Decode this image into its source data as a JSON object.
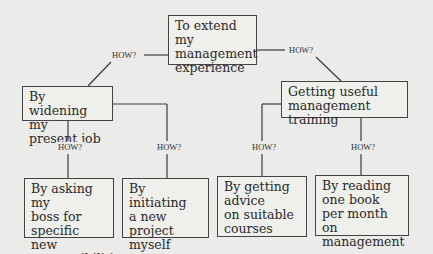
{
  "diagram": {
    "type": "how-tree",
    "root": {
      "label": "To extend\nmy management\nexperience"
    },
    "connector_label": "HOW?",
    "branches": [
      {
        "label": "By widening my\npresent job",
        "children": [
          {
            "label": "By asking my\nboss for\nspecific new\nresponsibilities"
          },
          {
            "label": "By initiating\na new\nproject myself"
          }
        ]
      },
      {
        "label": "Getting useful\nmanagement training",
        "children": [
          {
            "label": "By getting\nadvice\non suitable\ncourses"
          },
          {
            "label": "By reading\none book\nper month on\nmanagement"
          }
        ]
      }
    ]
  }
}
